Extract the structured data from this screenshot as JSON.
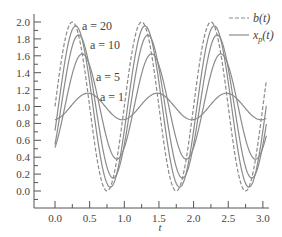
{
  "chart_data": {
    "type": "line",
    "title": "",
    "xlabel": "t",
    "ylabel": "",
    "xlim": [
      -0.1,
      3.1
    ],
    "ylim": [
      -0.15,
      2.05
    ],
    "grid": false,
    "legend_position": "top-right",
    "x_ticks": [
      "0.0",
      "0.5",
      "1.0",
      "1.5",
      "2.0",
      "2.5",
      "3.0"
    ],
    "x_tick_values": [
      0.0,
      0.5,
      1.0,
      1.5,
      2.0,
      2.5,
      3.0
    ],
    "y_ticks": [
      "0.0",
      "0.2",
      "0.4",
      "0.6",
      "0.8",
      "1.0",
      "1.2",
      "1.4",
      "1.6",
      "1.8",
      "2.0"
    ],
    "y_tick_values": [
      0.0,
      0.2,
      0.4,
      0.6,
      0.8,
      1.0,
      1.2,
      1.4,
      1.6,
      1.8,
      2.0
    ],
    "legend": [
      {
        "label": "b(t)",
        "style": "dashed"
      },
      {
        "label": "x_p(t)",
        "style": "solid"
      }
    ],
    "model": {
      "input": "b(t) = 1 + sin(2πt)",
      "response": "x_p(t) = 1 + a/sqrt(a^2+4π^2) · sin(2πt − atan(2π/a))",
      "t_range": [
        0.0,
        3.05
      ]
    },
    "series": [
      {
        "name": "b(t)",
        "style": "dashed",
        "a": null,
        "x": [
          0.0,
          0.25,
          0.5,
          0.75,
          1.0,
          1.25,
          1.5,
          1.75,
          2.0,
          2.25,
          2.5,
          2.75,
          3.0
        ],
        "values": [
          1.0,
          2.0,
          1.0,
          0.0,
          1.0,
          2.0,
          1.0,
          0.0,
          1.0,
          2.0,
          1.0,
          0.0,
          1.0
        ]
      },
      {
        "name": "x_p(t), a = 20",
        "style": "solid",
        "a": 20,
        "label": "a = 20",
        "amplitude": 0.954,
        "peak": 1.95,
        "min": 0.05
      },
      {
        "name": "x_p(t), a = 10",
        "style": "solid",
        "a": 10,
        "label": "a = 10",
        "amplitude": 0.847,
        "peak": 1.85,
        "min": 0.15
      },
      {
        "name": "x_p(t), a = 5",
        "style": "solid",
        "a": 5,
        "label": "a = 5",
        "amplitude": 0.623,
        "peak": 1.62,
        "min": 0.38
      },
      {
        "name": "x_p(t), a = 1",
        "style": "solid",
        "a": 1,
        "label": "a = 1",
        "amplitude": 0.157,
        "peak": 1.16,
        "min": 0.84
      }
    ],
    "annotations": [
      {
        "text": "a = 20",
        "t": 0.4,
        "y": 1.95
      },
      {
        "text": "a = 10",
        "t": 0.5,
        "y": 1.72
      },
      {
        "text": "a = 5",
        "t": 0.6,
        "y": 1.35
      },
      {
        "text": "a = 1",
        "t": 0.65,
        "y": 1.1
      }
    ]
  },
  "labels": {
    "xlabel": "t",
    "legend_b": "b(t)",
    "legend_xp_main": "x",
    "legend_xp_sub": "p",
    "legend_xp_tail": "(t)",
    "a20": "a = 20",
    "a10": "a = 10",
    "a5": "a = 5",
    "a1": "a = 1"
  },
  "colors": {
    "curve": "#8a8a8a",
    "axis": "#555555",
    "text": "#444444"
  }
}
